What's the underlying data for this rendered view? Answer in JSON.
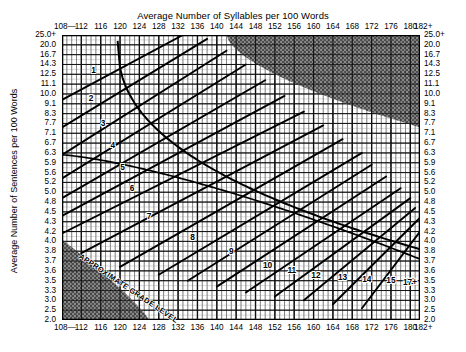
{
  "chart_data": {
    "type": "line",
    "title": "Average Number of Syllables per 100 Words",
    "xlabel": "Average Number of Syllables per 100 Words",
    "ylabel": "Average Number of Sentences per 100 Words",
    "grid": true,
    "legend": "none",
    "xlim": [
      108,
      182
    ],
    "ylim": [
      2.0,
      25.0
    ],
    "x_ticks": [
      "108—",
      "112",
      "116",
      "120",
      "124",
      "128",
      "132",
      "136",
      "140",
      "144",
      "148",
      "152",
      "156",
      "160",
      "164",
      "168",
      "172",
      "176",
      "180",
      "182+"
    ],
    "x_ticks_bottom": [
      "108—",
      "112",
      "116",
      "120",
      "124",
      "128",
      "132",
      "136",
      "140",
      "144",
      "148",
      "152",
      "156",
      "160",
      "164",
      "168",
      "172",
      "176",
      "180",
      "182+"
    ],
    "x_tick_values": [
      108,
      112,
      116,
      120,
      124,
      128,
      132,
      136,
      140,
      144,
      148,
      152,
      156,
      160,
      164,
      168,
      172,
      176,
      180,
      182
    ],
    "y_ticks": [
      "25.0+",
      "20.0",
      "16.7",
      "14.3",
      "12.5",
      "11.1",
      "10.0",
      "9.1",
      "8.3",
      "7.7",
      "7.1",
      "6.7",
      "6.3",
      "5.9",
      "5.6",
      "5.2",
      "5.0",
      "4.8",
      "4.5",
      "4.3",
      "4.2",
      "4.0",
      "3.8",
      "3.7",
      "3.6",
      "3.5",
      "3.3",
      "3.0",
      "2.5",
      "2.0"
    ],
    "grade_labels": [
      "1",
      "2",
      "3",
      "4",
      "5",
      "6",
      "7",
      "8",
      "9",
      "10",
      "11",
      "12",
      "13",
      "14",
      "15",
      "16",
      "17+"
    ],
    "annotation": "APPROXIMATE GRADE LEVEL",
    "shaded_regions": [
      "upper-right invalid zone",
      "lower-left invalid zone"
    ],
    "colors": {
      "line": "#000000",
      "grid": "#7a7a7a",
      "frame": "#000000",
      "shade": "#5a5a5a",
      "background": "#ffffff"
    }
  },
  "axes": {
    "top_title": "Average Number of Syllables per 100 Words",
    "left_title": "Average Number of Sentences per 100 Words"
  },
  "annotations": {
    "grade_level_text": "APPROXIMATE GRADE LEVEL"
  }
}
